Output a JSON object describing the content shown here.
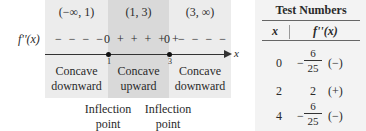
{
  "sign_chart": {
    "function_label": "f''(x)",
    "axis_label": "x",
    "intervals": [
      {
        "label": "(−∞, 1)",
        "sign": "− − − −",
        "concavity": [
          "Concave",
          "downward"
        ]
      },
      {
        "label": "(1, 3)",
        "sign": "+ + + + +",
        "concavity": [
          "Concave",
          "upward"
        ]
      },
      {
        "label": "(3, ∞)",
        "sign": "− − − −",
        "concavity": [
          "Concave",
          "downward"
        ]
      }
    ],
    "zeros": [
      {
        "value": "0",
        "x_tick": "1"
      },
      {
        "value": "0",
        "x_tick": "3"
      }
    ],
    "inflection_points": [
      {
        "line1": "Inflection",
        "line2": "point"
      },
      {
        "line1": "Inflection",
        "line2": "point"
      }
    ],
    "colors": {
      "outer_band": "#ececec",
      "middle_band": "#d9d9d9",
      "axis": "#333333"
    }
  },
  "table": {
    "title": "Test Numbers",
    "headers": [
      "x",
      "f''(x)"
    ],
    "rows": [
      {
        "x": "0",
        "minus": "−",
        "numerator": "6",
        "denominator": "25",
        "sign": "(−)"
      },
      {
        "x": "2",
        "value": "2",
        "sign": "(+)"
      },
      {
        "x": "4",
        "minus": "−",
        "numerator": "6",
        "denominator": "25",
        "sign": "(−)"
      }
    ]
  }
}
